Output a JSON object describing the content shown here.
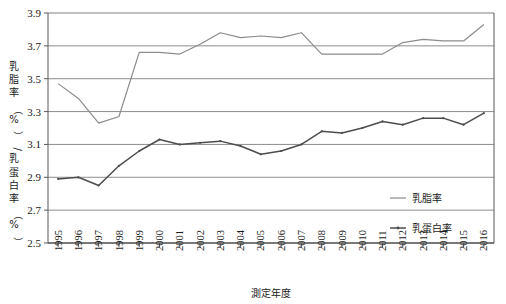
{
  "chart_data": {
    "type": "line",
    "title": "",
    "xlabel": "測定年度",
    "ylabel": "乳脂率（%）/乳蛋白率（%）",
    "ylabel_chars": [
      "乳",
      "脂",
      "率",
      "（",
      "%",
      "）",
      "/",
      "乳",
      "蛋",
      "白",
      "率",
      "（",
      "%",
      "）"
    ],
    "ylim": [
      2.5,
      3.9
    ],
    "ytick_step": 0.2,
    "yticks": [
      "3.9",
      "3.7",
      "3.5",
      "3.3",
      "3.1",
      "2.9",
      "2.7",
      "2.5"
    ],
    "ytick_values": [
      3.9,
      3.7,
      3.5,
      3.3,
      3.1,
      2.9,
      2.7,
      2.5
    ],
    "grid": "horizontal",
    "legend_position": "inside-right",
    "categories": [
      "1995",
      "1996",
      "1997",
      "1998",
      "1999",
      "2000",
      "2001",
      "2002",
      "2003",
      "2004",
      "2005",
      "2006",
      "2007",
      "2008",
      "2009",
      "2010",
      "2011",
      "2012",
      "2013",
      "2014",
      "2015",
      "2016"
    ],
    "series": [
      {
        "name": "乳脂率",
        "color": "#8c8c8c",
        "marker": "none",
        "values": [
          3.47,
          3.38,
          3.23,
          3.27,
          3.66,
          3.66,
          3.65,
          3.71,
          3.78,
          3.75,
          3.76,
          3.75,
          3.78,
          3.65,
          3.65,
          3.65,
          3.65,
          3.72,
          3.74,
          3.73,
          3.73,
          3.83
        ]
      },
      {
        "name": "乳蛋白率",
        "color": "#4d4d4d",
        "marker": "dot",
        "values": [
          2.89,
          2.9,
          2.85,
          2.97,
          3.06,
          3.13,
          3.1,
          3.11,
          3.12,
          3.09,
          3.04,
          3.06,
          3.1,
          3.18,
          3.17,
          3.2,
          3.24,
          3.22,
          3.26,
          3.26,
          3.22,
          3.29
        ]
      }
    ]
  },
  "legend": {
    "items": [
      {
        "label": "乳脂率",
        "color": "#8c8c8c"
      },
      {
        "label": "乳蛋白率",
        "color": "#4d4d4d"
      }
    ]
  },
  "colors": {
    "fat_line": "#8c8c8c",
    "protein_line": "#4d4d4d",
    "gridline": "#808080",
    "axis": "#595959",
    "background": "#ffffff"
  }
}
